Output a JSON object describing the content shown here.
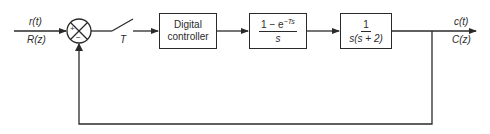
{
  "diagram": {
    "type": "sampled-data closed-loop control block diagram",
    "input": {
      "time_label": "r(t)",
      "z_label": "R(z)"
    },
    "output": {
      "time_label": "c(t)",
      "z_label": "C(z)"
    },
    "summing_junction": {
      "plus_sign": "+",
      "minus_sign": "−"
    },
    "sampler": {
      "label": "T"
    },
    "blocks": [
      {
        "id": "controller",
        "line1": "Digital",
        "line2": "controller"
      },
      {
        "id": "zoh",
        "numerator_prefix": "1 − e",
        "numerator_exponent": "−Ts",
        "denominator": "s"
      },
      {
        "id": "plant",
        "numerator": "1",
        "denominator": "s(s + 2)"
      }
    ],
    "feedback": {
      "sign": "negative",
      "from": "output",
      "to": "summing_junction"
    }
  }
}
